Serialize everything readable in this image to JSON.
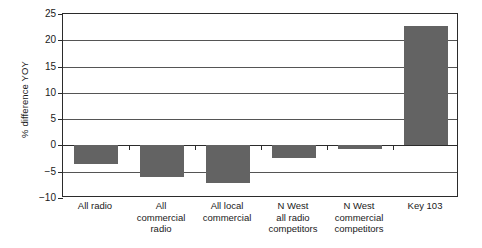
{
  "chart_data": {
    "type": "bar",
    "title": "",
    "xlabel": "",
    "ylabel": "% difference YOY",
    "ylim": [
      -10,
      25
    ],
    "ytick_values": [
      25,
      20,
      15,
      10,
      5,
      0,
      -5,
      -10
    ],
    "ytick_labels": [
      "25",
      "20",
      "15",
      "10",
      "5",
      "0",
      "−5",
      "−10"
    ],
    "grid": true,
    "legend": "none",
    "bar_color": "#636363",
    "categories": [
      "All radio",
      "All\ncommercial\nradio",
      "All local\ncommercial",
      "N West\nall radio\ncompetitors",
      "N West\ncommercial\ncompetitors",
      "Key 103"
    ],
    "values": [
      -3.6,
      -6.1,
      -7.1,
      -2.3,
      -0.7,
      22.8
    ]
  },
  "figure": {
    "caption": ""
  }
}
